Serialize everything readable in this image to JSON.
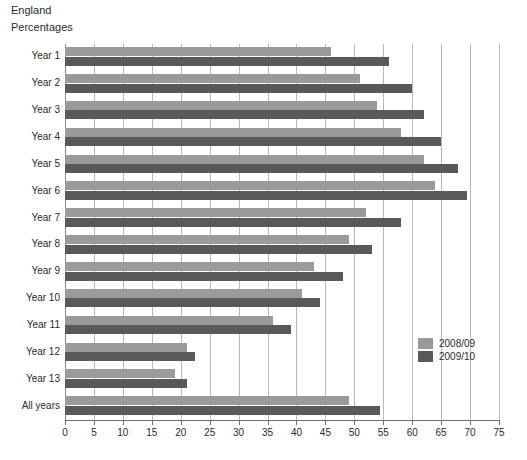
{
  "header": {
    "region": "England",
    "units": "Percentages"
  },
  "legend": {
    "position": "inside-right-lower",
    "entries": [
      {
        "label": "2008/09",
        "color": "#9a9a9a"
      },
      {
        "label": "2009/10",
        "color": "#595959"
      }
    ]
  },
  "colors": {
    "series_2008_09": "#9a9a9a",
    "series_2009_10": "#595959",
    "gridline": "#b9b9b9",
    "axis": "#6f6f6f",
    "text": "#2b2b2b",
    "background": "#ffffff"
  },
  "chart_data": {
    "type": "bar",
    "orientation": "horizontal",
    "title": "England",
    "subtitle": "Percentages",
    "xlabel": "",
    "ylabel": "",
    "xlim": [
      0,
      75
    ],
    "xticks": [
      0,
      5,
      10,
      15,
      20,
      25,
      30,
      35,
      40,
      45,
      50,
      55,
      60,
      65,
      70,
      75
    ],
    "grid": "vertical",
    "legend_position": "inside-right-lower",
    "categories": [
      "Year 1",
      "Year 2",
      "Year 3",
      "Year 4",
      "Year 5",
      "Year 6",
      "Year 7",
      "Year 8",
      "Year 9",
      "Year 10",
      "Year 11",
      "Year 12",
      "Year 13",
      "All years"
    ],
    "series": [
      {
        "name": "2008/09",
        "color": "#9a9a9a",
        "values": [
          46,
          51,
          54,
          58,
          62,
          64,
          52,
          49,
          43,
          41,
          36,
          21,
          19,
          49
        ]
      },
      {
        "name": "2009/10",
        "color": "#595959",
        "values": [
          56,
          60,
          62,
          65,
          68,
          69.5,
          58,
          53,
          48,
          44,
          39,
          22.5,
          21,
          54.5
        ]
      }
    ]
  }
}
